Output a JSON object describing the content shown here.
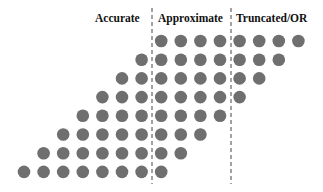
{
  "diagram": {
    "regions": [
      {
        "name": "accurate",
        "label": "Accurate",
        "col_range": [
          0,
          6
        ]
      },
      {
        "name": "approximate",
        "label": "Approximate",
        "col_range": [
          7,
          10
        ]
      },
      {
        "name": "truncated",
        "label": "Truncated/OR",
        "col_range": [
          11,
          14
        ]
      }
    ],
    "dot_color": "#6f6f6f",
    "divider_color": "#444444",
    "columns": 15,
    "rows": [
      {
        "start_col": 7,
        "end_col": 14
      },
      {
        "start_col": 6,
        "end_col": 13
      },
      {
        "start_col": 5,
        "end_col": 12
      },
      {
        "start_col": 4,
        "end_col": 11
      },
      {
        "start_col": 3,
        "end_col": 10
      },
      {
        "start_col": 2,
        "end_col": 9
      },
      {
        "start_col": 1,
        "end_col": 8
      },
      {
        "start_col": 0,
        "end_col": 7
      }
    ]
  }
}
